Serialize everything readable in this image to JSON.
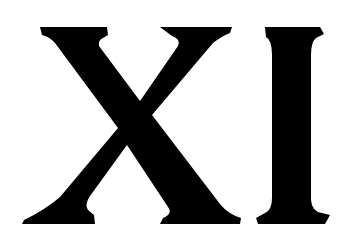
{
  "text": "XI",
  "letters": [
    {
      "char": "X"
    },
    {
      "char": "I"
    }
  ],
  "colors": {
    "glyph": "#000000",
    "background": "#ffffff"
  }
}
